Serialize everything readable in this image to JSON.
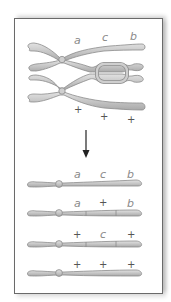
{
  "top": {
    "upper_labels": [
      "a",
      "c",
      "b"
    ],
    "lower_labels": [
      "+",
      "+",
      "+"
    ]
  },
  "arrow": {
    "direction": "down"
  },
  "products": [
    {
      "labels": [
        "a",
        "c",
        "b"
      ],
      "segments": "parental"
    },
    {
      "labels": [
        "a",
        "+",
        "b"
      ],
      "segments": "recombinant"
    },
    {
      "labels": [
        "+",
        "c",
        "+"
      ],
      "segments": "recombinant"
    },
    {
      "labels": [
        "+",
        "+",
        "+"
      ],
      "segments": "parental"
    }
  ],
  "colors": {
    "chromosome_fill": "#c9c9c9",
    "chromosome_stroke": "#8c8c8c",
    "label": "#8a8a8a",
    "border": "#6a6a6a"
  }
}
